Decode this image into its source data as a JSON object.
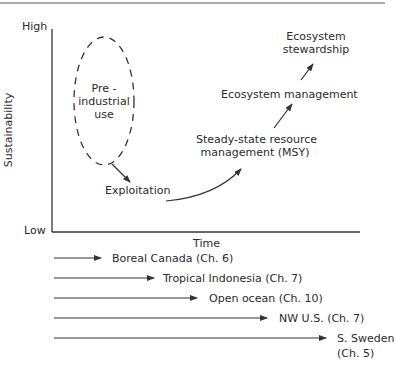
{
  "diagram": {
    "axes": {
      "y_label": "Sustainability",
      "y_high": "High",
      "y_low": "Low",
      "x_label": "Time"
    },
    "stages": {
      "pre_industrial": [
        "Pre -",
        "industrial",
        "use"
      ],
      "exploitation": "Exploitation",
      "steady_state": [
        "Steady-state resource",
        "management (MSY)"
      ],
      "ecosystem_management": "Ecosystem management",
      "ecosystem_stewardship": [
        "Ecosystem",
        "stewardship"
      ]
    },
    "regions": [
      {
        "label": "Boreal Canada  (Ch. 6)"
      },
      {
        "label": "Tropical Indonesia  (Ch. 7)"
      },
      {
        "label": "Open ocean  (Ch. 10)"
      },
      {
        "label": "NW U.S.  (Ch. 7)"
      },
      {
        "label": "S. Sweden",
        "label2": "(Ch. 5)"
      }
    ],
    "colors": {
      "line": "#333333",
      "text": "#2a2a2a",
      "background": "#ffffff"
    }
  }
}
